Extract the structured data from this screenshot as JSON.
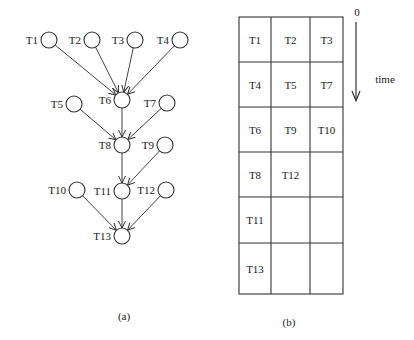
{
  "panel_a": {
    "caption": "(a)",
    "nodes": [
      {
        "id": "T1",
        "label": "T1",
        "x": 49,
        "y": 40
      },
      {
        "id": "T2",
        "label": "T2",
        "x": 92,
        "y": 40
      },
      {
        "id": "T3",
        "label": "T3",
        "x": 135,
        "y": 40
      },
      {
        "id": "T4",
        "label": "T4",
        "x": 180,
        "y": 40
      },
      {
        "id": "T5",
        "label": "T5",
        "x": 74,
        "y": 104
      },
      {
        "id": "T6",
        "label": "T6",
        "x": 122,
        "y": 100
      },
      {
        "id": "T7",
        "label": "T7",
        "x": 167,
        "y": 103
      },
      {
        "id": "T8",
        "label": "T8",
        "x": 122,
        "y": 145
      },
      {
        "id": "T9",
        "label": "T9",
        "x": 165,
        "y": 145
      },
      {
        "id": "T10",
        "label": "T10",
        "x": 77,
        "y": 190
      },
      {
        "id": "T11",
        "label": "T11",
        "x": 122,
        "y": 191
      },
      {
        "id": "T12",
        "label": "T12",
        "x": 166,
        "y": 190
      },
      {
        "id": "T13",
        "label": "T13",
        "x": 122,
        "y": 236
      }
    ],
    "edges": [
      [
        "T1",
        "T6"
      ],
      [
        "T2",
        "T6"
      ],
      [
        "T3",
        "T6"
      ],
      [
        "T4",
        "T6"
      ],
      [
        "T5",
        "T8"
      ],
      [
        "T6",
        "T8"
      ],
      [
        "T7",
        "T8"
      ],
      [
        "T8",
        "T11"
      ],
      [
        "T9",
        "T11"
      ],
      [
        "T10",
        "T13"
      ],
      [
        "T11",
        "T13"
      ],
      [
        "T12",
        "T13"
      ]
    ]
  },
  "panel_b": {
    "caption": "(b)",
    "time_axis": {
      "start_label": "0",
      "label": "time"
    },
    "rows": [
      [
        "T1",
        "T2",
        "T3"
      ],
      [
        "T4",
        "T5",
        "T7"
      ],
      [
        "T6",
        "T9",
        "T10"
      ],
      [
        "T8",
        "T12",
        ""
      ],
      [
        "T11",
        "",
        ""
      ],
      [
        "T13",
        "",
        ""
      ]
    ]
  }
}
